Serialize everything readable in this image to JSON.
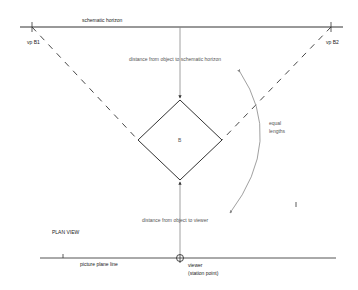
{
  "diagram": {
    "horizon_label": "schematic horizon",
    "vp_left_label": "vp B1",
    "vp_right_label": "vp B2",
    "distance_to_horizon_label": "distance from object to schematic horizon",
    "object_label": "B",
    "equal_lengths_line1": "equal",
    "equal_lengths_line2": "lengths",
    "distance_to_viewer_label": "distance from object to viewer",
    "plan_view_label": "PLAN VIEW",
    "picture_plane_label": "picture plane line",
    "viewer_line1": "viewer",
    "viewer_line2": "(station point)",
    "colors": {
      "line": "#333333",
      "arrow_gray": "#888888",
      "text": "#555555"
    }
  }
}
